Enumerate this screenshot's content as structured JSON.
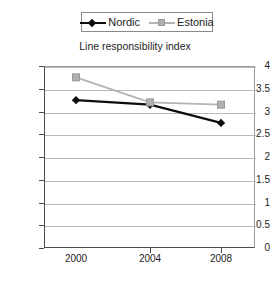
{
  "chart_data": {
    "type": "line",
    "title": "Line responsibility index",
    "xlabel": "",
    "ylabel": "",
    "categories": [
      "2000",
      "2004",
      "2008"
    ],
    "x": [
      2000,
      2004,
      2008
    ],
    "series": [
      {
        "name": "Nordic",
        "values": [
          3.25,
          3.15,
          2.75
        ],
        "color": "#0d0d0d",
        "marker": "diamond"
      },
      {
        "name": "Estonia",
        "values": [
          3.75,
          3.2,
          3.15
        ],
        "color": "#b4b4b4",
        "marker": "square"
      }
    ],
    "ylim": [
      0,
      4
    ],
    "yticks": [
      "0",
      "0.5",
      "1",
      "1.5",
      "2",
      "2.5",
      "3",
      "3.5",
      "4"
    ],
    "ytick_values": [
      0,
      0.5,
      1,
      1.5,
      2,
      2.5,
      3,
      3.5,
      4
    ],
    "grid": true,
    "legend_position": "top"
  },
  "legend": {
    "entries": [
      {
        "label": "Nordic"
      },
      {
        "label": "Estonia"
      }
    ]
  },
  "axes": {
    "x_labels": [
      "2000",
      "2004",
      "2008"
    ],
    "y_labels": [
      "4",
      "3.5",
      "3",
      "2.5",
      "2",
      "1.5",
      "1",
      "0.5",
      "0"
    ]
  }
}
